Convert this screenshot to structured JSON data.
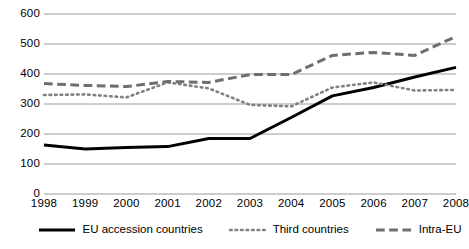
{
  "chart_data": {
    "type": "line",
    "title": "",
    "subtitle": "",
    "xlabel": "",
    "ylabel": "",
    "categories": [
      "1998",
      "1999",
      "2000",
      "2001",
      "2002",
      "2003",
      "2004",
      "2005",
      "2006",
      "2007",
      "2008"
    ],
    "x": [
      1998,
      1999,
      2000,
      2001,
      2002,
      2003,
      2004,
      2005,
      2006,
      2007,
      2008
    ],
    "ylim": [
      0,
      600
    ],
    "xlim": [
      1998,
      2008
    ],
    "yticks": [
      0,
      100,
      200,
      300,
      400,
      500,
      600
    ],
    "ytick_labels": [
      "0",
      "100",
      "200",
      "300",
      "400",
      "500",
      "600"
    ],
    "grid": true,
    "grid_axis": "y",
    "legend_position": "bottom",
    "series": [
      {
        "name": "EU accession countries",
        "style": "solid",
        "color": "#000000",
        "width": 3.0,
        "values": [
          163,
          150,
          155,
          158,
          185,
          185,
          255,
          327,
          355,
          390,
          422
        ]
      },
      {
        "name": "Third countries",
        "style": "dotted",
        "color": "#808080",
        "width": 2.6,
        "values": [
          330,
          332,
          322,
          372,
          352,
          297,
          292,
          355,
          372,
          345,
          347
        ]
      },
      {
        "name": "Intra-EU",
        "style": "dashed",
        "color": "#6e6e6e",
        "width": 3.0,
        "values": [
          368,
          362,
          358,
          375,
          372,
          398,
          398,
          462,
          472,
          462,
          525
        ]
      }
    ]
  },
  "legend": {
    "items": [
      {
        "label": "EU accession countries",
        "style": "solid"
      },
      {
        "label": "Third countries",
        "style": "dotted"
      },
      {
        "label": "Intra-EU",
        "style": "dashed"
      }
    ]
  },
  "colors": {
    "axis": "#000000",
    "gridline": "#9a9a9a",
    "series_solid": "#000000",
    "series_dotted": "#808080",
    "series_dashed": "#6e6e6e",
    "background": "#ffffff"
  }
}
